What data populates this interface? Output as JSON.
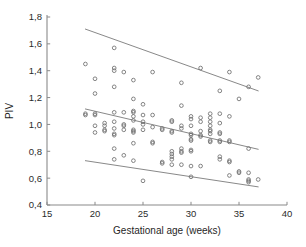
{
  "chart_data": {
    "type": "scatter",
    "title": "",
    "xlabel": "Gestational age (weeks)",
    "ylabel": "PIV",
    "xlim": [
      15,
      40
    ],
    "ylim": [
      0.4,
      1.8
    ],
    "xticks": [
      15,
      20,
      25,
      30,
      35,
      40
    ],
    "yticks": [
      0.4,
      0.6,
      0.8,
      1.0,
      1.2,
      1.4,
      1.6,
      1.8
    ],
    "xtick_labels": [
      "15",
      "20",
      "25",
      "30",
      "35",
      "40"
    ],
    "ytick_labels": [
      "0,4",
      "0,6",
      "0,8",
      "1,0",
      "1,2",
      "1,4",
      "1,6",
      "1,8"
    ],
    "decimal_separator": ",",
    "grid": false,
    "legend": null,
    "marker_style": "open-circle",
    "marker_color": "#6f6f6f",
    "axis_color": "#8a8a8a",
    "points": [
      [
        19,
        1.45
      ],
      [
        19,
        1.08
      ],
      [
        19,
        1.07
      ],
      [
        20,
        1.34
      ],
      [
        20,
        1.23
      ],
      [
        20,
        1.08
      ],
      [
        20,
        1.07
      ],
      [
        20,
        0.99
      ],
      [
        20,
        0.94
      ],
      [
        21,
        1.01
      ],
      [
        21,
        0.99
      ],
      [
        21,
        0.96
      ],
      [
        21,
        0.95
      ],
      [
        22,
        1.57
      ],
      [
        22,
        1.42
      ],
      [
        22,
        1.4
      ],
      [
        22,
        1.28
      ],
      [
        22,
        1.09
      ],
      [
        22,
        1.02
      ],
      [
        22,
        0.97
      ],
      [
        22,
        0.93
      ],
      [
        22,
        0.92
      ],
      [
        22,
        0.82
      ],
      [
        22,
        0.74
      ],
      [
        23,
        1.39
      ],
      [
        23,
        1.09
      ],
      [
        23,
        1.0
      ],
      [
        23,
        0.99
      ],
      [
        23,
        0.96
      ],
      [
        23,
        0.77
      ],
      [
        24,
        1.33
      ],
      [
        24,
        1.19
      ],
      [
        24,
        1.1
      ],
      [
        24,
        1.09
      ],
      [
        24,
        1.06
      ],
      [
        24,
        1.03
      ],
      [
        24,
        0.96
      ],
      [
        24,
        0.95
      ],
      [
        24,
        0.94
      ],
      [
        24,
        0.86
      ],
      [
        24,
        0.73
      ],
      [
        25,
        1.15
      ],
      [
        25,
        1.07
      ],
      [
        25,
        1.02
      ],
      [
        25,
        1.0
      ],
      [
        25,
        0.96
      ],
      [
        25,
        0.58
      ],
      [
        26,
        1.39
      ],
      [
        26,
        1.07
      ],
      [
        26,
        0.98
      ],
      [
        26,
        0.87
      ],
      [
        26,
        0.86
      ],
      [
        27,
        0.97
      ],
      [
        27,
        0.96
      ],
      [
        27,
        0.72
      ],
      [
        27,
        0.71
      ],
      [
        28,
        1.03
      ],
      [
        28,
        1.02
      ],
      [
        28,
        0.95
      ],
      [
        28,
        0.94
      ],
      [
        28,
        0.8
      ],
      [
        28,
        0.78
      ],
      [
        28,
        0.76
      ],
      [
        28,
        0.74
      ],
      [
        28,
        0.7
      ],
      [
        29,
        1.31
      ],
      [
        29,
        1.14
      ],
      [
        29,
        0.99
      ],
      [
        29,
        0.97
      ],
      [
        29,
        0.82
      ],
      [
        29,
        0.8
      ],
      [
        29,
        0.79
      ],
      [
        29,
        0.7
      ],
      [
        30,
        1.06
      ],
      [
        30,
        1.04
      ],
      [
        30,
        0.99
      ],
      [
        30,
        0.93
      ],
      [
        30,
        0.92
      ],
      [
        30,
        0.89
      ],
      [
        30,
        0.88
      ],
      [
        30,
        0.81
      ],
      [
        30,
        0.8
      ],
      [
        30,
        0.69
      ],
      [
        30,
        0.61
      ],
      [
        31,
        1.42
      ],
      [
        31,
        1.05
      ],
      [
        31,
        1.02
      ],
      [
        31,
        0.95
      ],
      [
        31,
        0.92
      ],
      [
        31,
        0.91
      ],
      [
        31,
        0.69
      ],
      [
        32,
        1.08
      ],
      [
        32,
        1.05
      ],
      [
        32,
        1.02
      ],
      [
        32,
        0.99
      ],
      [
        32,
        0.96
      ],
      [
        32,
        0.95
      ],
      [
        32,
        0.93
      ],
      [
        32,
        0.88
      ],
      [
        32,
        0.87
      ],
      [
        33,
        1.25
      ],
      [
        33,
        1.08
      ],
      [
        33,
        1.01
      ],
      [
        33,
        0.94
      ],
      [
        33,
        0.93
      ],
      [
        33,
        0.88
      ],
      [
        33,
        0.87
      ],
      [
        33,
        0.76
      ],
      [
        33,
        0.74
      ],
      [
        34,
        1.39
      ],
      [
        34,
        1.06
      ],
      [
        34,
        0.88
      ],
      [
        34,
        0.87
      ],
      [
        34,
        0.73
      ],
      [
        34,
        0.72
      ],
      [
        34,
        0.62
      ],
      [
        35,
        1.19
      ],
      [
        35,
        0.65
      ],
      [
        35,
        0.64
      ],
      [
        36,
        1.28
      ],
      [
        36,
        0.82
      ],
      [
        36,
        0.64
      ],
      [
        36,
        0.59
      ],
      [
        36,
        0.58
      ],
      [
        36,
        0.57
      ],
      [
        37,
        1.35
      ],
      [
        37,
        0.59
      ]
    ],
    "trend_lines": [
      {
        "name": "upper-limit",
        "x": [
          19,
          37
        ],
        "y": [
          1.71,
          1.25
        ]
      },
      {
        "name": "regression-mean",
        "x": [
          19,
          37
        ],
        "y": [
          1.115,
          0.815
        ]
      },
      {
        "name": "lower-limit",
        "x": [
          19,
          37
        ],
        "y": [
          0.73,
          0.535
        ]
      }
    ]
  }
}
